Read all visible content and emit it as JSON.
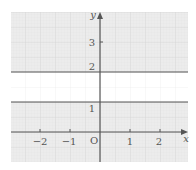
{
  "diagram": {
    "type": "coordinate-plane",
    "axes": {
      "x_label": "x",
      "y_label": "y",
      "origin_label": "O",
      "x_ticks": [
        {
          "value": -2,
          "label": "−2"
        },
        {
          "value": -1,
          "label": "−1"
        },
        {
          "value": 1,
          "label": "1"
        },
        {
          "value": 2,
          "label": "2"
        }
      ],
      "y_ticks": [
        {
          "value": 1,
          "label": "1"
        },
        {
          "value": 2,
          "label": "2"
        },
        {
          "value": 3,
          "label": "3"
        }
      ],
      "x_range": [
        -2.97,
        2.93
      ],
      "y_range": [
        -1,
        4
      ]
    },
    "lines": [
      {
        "equation": "y = 2",
        "y": 2
      },
      {
        "equation": "y = 1",
        "y": 1
      }
    ],
    "unshaded_region": {
      "description": "1 < y < 2",
      "y_min": 1,
      "y_max": 2
    },
    "shaded_region": {
      "description": "y <= 1 or y >= 2"
    },
    "colors": {
      "shade": "#e9e9e9",
      "grid_major": "#d6d6d6",
      "grid_minor": "#e0e0e0",
      "axis": "#555555",
      "line": "#555555",
      "unshaded": "#ffffff"
    }
  }
}
